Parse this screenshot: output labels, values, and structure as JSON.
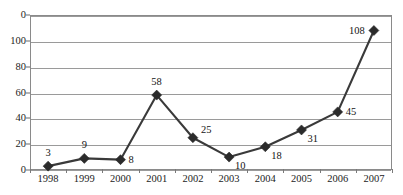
{
  "chart_data": {
    "type": "line",
    "title": "",
    "xlabel": "",
    "ylabel": "",
    "categories": [
      "1998",
      "1999",
      "2000",
      "2001",
      "2002",
      "2003",
      "2004",
      "2005",
      "2006",
      "2007"
    ],
    "values": [
      3,
      9,
      8,
      58,
      25,
      10,
      18,
      31,
      45,
      108
    ],
    "series": [
      {
        "name": "",
        "values": [
          3,
          9,
          8,
          58,
          25,
          10,
          18,
          31,
          45,
          108
        ]
      }
    ],
    "point_labels": [
      "3",
      "9",
      "8",
      "58",
      "25",
      "10",
      "18",
      "31",
      "45",
      "108"
    ],
    "ytick_labels": [
      "0",
      "100",
      "80",
      "60",
      "40",
      "20",
      "0"
    ],
    "ytick_values": [
      120,
      100,
      80,
      60,
      40,
      20,
      0
    ],
    "ylim": [
      0,
      120
    ],
    "grid": "horizontal",
    "legend": "none",
    "marker": "diamond",
    "colors": {
      "line": "#3a3a3a",
      "marker": "#2b2b2b",
      "grid": "#9a9a9a",
      "frame": "#8a8a8a",
      "text": "#1c1c1c",
      "background": "#ffffff"
    }
  },
  "axes": {
    "y_ticks": [
      {
        "label": "0",
        "value": 120
      },
      {
        "label": "100",
        "value": 100
      },
      {
        "label": "80",
        "value": 80
      },
      {
        "label": "60",
        "value": 60
      },
      {
        "label": "40",
        "value": 40
      },
      {
        "label": "20",
        "value": 20
      },
      {
        "label": "0",
        "value": 0
      }
    ],
    "x_ticks": [
      {
        "label": "1998"
      },
      {
        "label": "1999"
      },
      {
        "label": "2000"
      },
      {
        "label": "2001"
      },
      {
        "label": "2002"
      },
      {
        "label": "2003"
      },
      {
        "label": "2004"
      },
      {
        "label": "2005"
      },
      {
        "label": "2006"
      },
      {
        "label": "2007"
      }
    ]
  },
  "points": [
    {
      "category": "1998",
      "value": 3,
      "label": "3",
      "label_pos": "above"
    },
    {
      "category": "1999",
      "value": 9,
      "label": "9",
      "label_pos": "above"
    },
    {
      "category": "2000",
      "value": 8,
      "label": "8",
      "label_pos": "right"
    },
    {
      "category": "2001",
      "value": 58,
      "label": "58",
      "label_pos": "above"
    },
    {
      "category": "2002",
      "value": 25,
      "label": "25",
      "label_pos": "above-right"
    },
    {
      "category": "2003",
      "value": 10,
      "label": "10",
      "label_pos": "below-right"
    },
    {
      "category": "2004",
      "value": 18,
      "label": "18",
      "label_pos": "below-right"
    },
    {
      "category": "2005",
      "value": 31,
      "label": "31",
      "label_pos": "below-right"
    },
    {
      "category": "2006",
      "value": 45,
      "label": "45",
      "label_pos": "right"
    },
    {
      "category": "2007",
      "value": 108,
      "label": "108",
      "label_pos": "left"
    }
  ]
}
